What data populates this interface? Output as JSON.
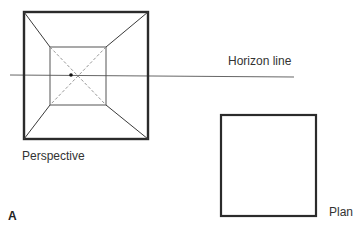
{
  "figure": {
    "letter": "A",
    "labels": {
      "horizon": "Horizon line",
      "perspective": "Perspective",
      "plan": "Plan"
    },
    "colors": {
      "stroke": "#2b2b2b",
      "thin": "#555555",
      "dashed": "#8a8a8a",
      "background": "#ffffff"
    },
    "perspective_view": {
      "outer_square": {
        "x1": 24,
        "y1": 12,
        "x2": 148,
        "y2": 139
      },
      "inner_square": {
        "x1": 50,
        "y1": 47,
        "x2": 106,
        "y2": 105
      },
      "vanishing_point": {
        "x": 71,
        "y": 75
      }
    },
    "horizon_line": {
      "x1": 10,
      "y1": 75,
      "x2": 294,
      "y2": 77
    },
    "plan_view": {
      "square": {
        "x1": 221,
        "y1": 115,
        "x2": 316,
        "y2": 216
      }
    }
  }
}
